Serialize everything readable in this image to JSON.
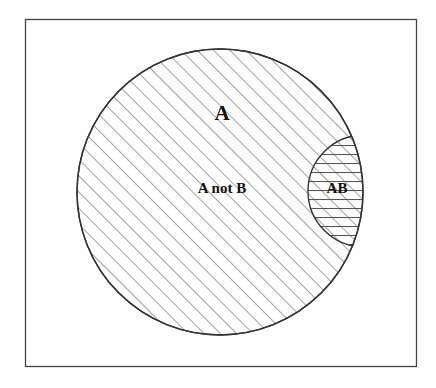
{
  "diagram": {
    "type": "venn",
    "title": "",
    "universe_box": {
      "x": 25,
      "y": 19,
      "width": 391,
      "height": 347
    },
    "sets": [
      {
        "id": "A",
        "label": "A",
        "cx": 220,
        "cy": 192,
        "r": 143,
        "hatch": "diagonal"
      },
      {
        "id": "B_part",
        "label": "",
        "cx": 364,
        "cy": 191,
        "r": 56,
        "hatch": "horizontal",
        "clipped_to": "A"
      }
    ],
    "labels": {
      "set_a": "A",
      "a_not_b": "A not B",
      "intersection": "AB"
    },
    "colors": {
      "line": "#333333",
      "hatch": "#555555",
      "background": "#ffffff",
      "text": "#111111"
    }
  }
}
